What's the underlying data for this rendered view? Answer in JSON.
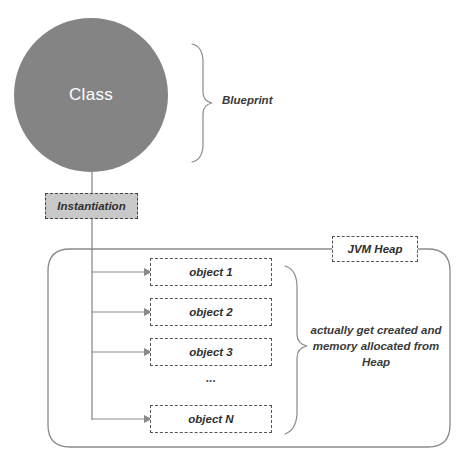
{
  "diagram": {
    "title_shape": {
      "label": "Class",
      "shape": "circle",
      "fill": "#848484",
      "text_color": "#ffffff"
    },
    "instantiation": {
      "label": "Instantiation",
      "fill": "#c9c9c9",
      "border": "dashed"
    },
    "jvm_heap": {
      "label": "JVM Heap",
      "fill": "#ffffff",
      "border": "dashed"
    },
    "objects": [
      {
        "label": "object 1"
      },
      {
        "label": "object 2"
      },
      {
        "label": "object 3"
      },
      {
        "label": "object N"
      }
    ],
    "ellipsis": "...",
    "annotations": {
      "blueprint": "Blueprint",
      "heap_note": "actually get created and memory allocated from Heap"
    },
    "colors": {
      "line": "#8a8a8a",
      "text": "#2f2f2f",
      "circle_fill": "#848484",
      "box_fill": "#c9c9c9"
    }
  }
}
